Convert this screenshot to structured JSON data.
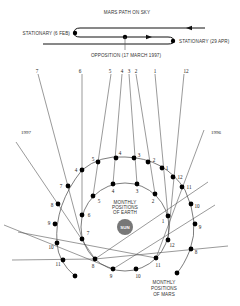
{
  "sky_path": {
    "title": "MARS PATH ON SKY",
    "stationary_1": "STATIONARY (6 FEB)",
    "stationary_2": "STATIONARY (29 APR)",
    "opposition": "OPPOSITION (17 MARCH 1997)"
  },
  "sight_line_labels": [
    "7",
    "6",
    "5",
    "4",
    "3",
    "2",
    "1",
    "12"
  ],
  "year_labels": {
    "left": "1997",
    "right": "1996"
  },
  "sun_label": "SUN",
  "earth_caption": [
    "MONTHLY",
    "POSITIONS",
    "OF EARTH"
  ],
  "mars_caption": [
    "MONTHLY",
    "POSITIONS",
    "OF MARS"
  ],
  "earth_positions": [
    {
      "label": "4",
      "x": 113,
      "y": 184
    },
    {
      "label": "3",
      "x": 137,
      "y": 184
    },
    {
      "label": "2",
      "x": 155,
      "y": 194
    },
    {
      "label": "5",
      "x": 93,
      "y": 196
    },
    {
      "label": "6",
      "x": 82,
      "y": 215
    },
    {
      "label": "1",
      "x": 168,
      "y": 216
    },
    {
      "label": "7",
      "x": 82,
      "y": 239
    },
    {
      "label": "12",
      "x": 168,
      "y": 240
    },
    {
      "label": "8",
      "x": 95,
      "y": 259
    },
    {
      "label": "11",
      "x": 156,
      "y": 258
    },
    {
      "label": "9",
      "x": 113,
      "y": 269
    },
    {
      "label": "10",
      "x": 136,
      "y": 269
    }
  ],
  "mars_positions": [
    {
      "label": "7",
      "x": 68,
      "y": 186
    },
    {
      "label": "4",
      "x": 82,
      "y": 170
    },
    {
      "label": "5",
      "x": 98,
      "y": 162
    },
    {
      "label": "4",
      "x": 116,
      "y": 158
    },
    {
      "label": "3",
      "x": 134,
      "y": 158
    },
    {
      "label": "2",
      "x": 148,
      "y": 162
    },
    {
      "label": "1",
      "x": 162,
      "y": 168
    },
    {
      "label": "12",
      "x": 173,
      "y": 177
    },
    {
      "label": "11",
      "x": 182,
      "y": 187
    },
    {
      "label": "10",
      "x": 191,
      "y": 204
    },
    {
      "label": "9",
      "x": 195,
      "y": 224
    },
    {
      "label": "8",
      "x": 191,
      "y": 249
    },
    {
      "label": "8",
      "x": 58,
      "y": 204
    },
    {
      "label": "9",
      "x": 55,
      "y": 224
    },
    {
      "label": "10",
      "x": 57,
      "y": 243
    },
    {
      "label": "11",
      "x": 63,
      "y": 260
    }
  ]
}
